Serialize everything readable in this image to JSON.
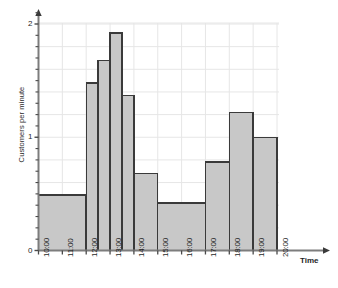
{
  "chart_data": {
    "type": "bar",
    "title": "",
    "subtitle": "",
    "xlabel": "Time",
    "ylabel": "Customers per minute",
    "xlim": [
      "10:00",
      "20:00"
    ],
    "ylim": [
      0,
      2.1
    ],
    "grid": true,
    "legend": null,
    "y_ticks": [
      {
        "value": 0,
        "label": "0"
      },
      {
        "value": 1,
        "label": "1"
      },
      {
        "value": 2,
        "label": "2"
      }
    ],
    "y_minor_tick_step": 0.1,
    "x_ticks": [
      {
        "value": 10,
        "label": "10:00"
      },
      {
        "value": 11,
        "label": "11:00"
      },
      {
        "value": 12,
        "label": "12:00"
      },
      {
        "value": 13,
        "label": "13:00"
      },
      {
        "value": 14,
        "label": "14:00"
      },
      {
        "value": 15,
        "label": "15:00"
      },
      {
        "value": 16,
        "label": "16:00"
      },
      {
        "value": 17,
        "label": "17:00"
      },
      {
        "value": 18,
        "label": "18:00"
      },
      {
        "value": 19,
        "label": "19:00"
      },
      {
        "value": 20,
        "label": "20:00"
      }
    ],
    "bars": [
      {
        "label": "10:00-12:00",
        "x_start": 10,
        "x_end": 12,
        "value": 0.49
      },
      {
        "label": "12:00-12:30",
        "x_start": 12,
        "x_end": 12.5,
        "value": 1.48
      },
      {
        "label": "12:30-13:00",
        "x_start": 12.5,
        "x_end": 13,
        "value": 1.68
      },
      {
        "label": "13:00-13:30",
        "x_start": 13,
        "x_end": 13.5,
        "value": 1.92
      },
      {
        "label": "13:30-14:00",
        "x_start": 13.5,
        "x_end": 14,
        "value": 1.37
      },
      {
        "label": "14:00-15:00",
        "x_start": 14,
        "x_end": 15,
        "value": 0.68
      },
      {
        "label": "15:00-17:00",
        "x_start": 15,
        "x_end": 17,
        "value": 0.42
      },
      {
        "label": "17:00-18:00",
        "x_start": 17,
        "x_end": 18,
        "value": 0.78
      },
      {
        "label": "18:00-19:00",
        "x_start": 18,
        "x_end": 19,
        "value": 1.22
      },
      {
        "label": "19:00-20:00",
        "x_start": 19,
        "x_end": 20,
        "value": 1.0
      }
    ],
    "colors": {
      "bar_fill": "#c8c8c8",
      "bar_stroke": "#3a3a3a",
      "grid": "#e6e6e6",
      "axis": "#7d7d7d",
      "text": "#1f1f1f"
    }
  }
}
